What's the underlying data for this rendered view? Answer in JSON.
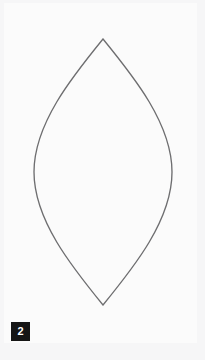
{
  "canvas": {
    "width": 205,
    "height": 360,
    "background_color": "#f6f6f7",
    "page_color": "#fbfbfb"
  },
  "figure": {
    "name": "vesica-piscis-lens-outline",
    "stroke_color": "#6e6e70",
    "stroke_width": 1.35,
    "fill": "none",
    "geometry": {
      "apex_top": [
        103,
        39
      ],
      "apex_bottom": [
        103,
        305
      ],
      "leftmost": [
        34,
        172
      ],
      "rightmost": [
        172,
        172
      ],
      "width": 138,
      "height": 266
    },
    "path": "M 103 39 C 134 77 172 124 172 172 C 172 220 134 267 103 305 C 72 267 34 220 34 172 C 34 124 72 77 103 39 Z"
  },
  "badge": {
    "label": "2",
    "background_color": "#151515",
    "text_color": "#ffffff",
    "position": [
      11,
      322
    ],
    "size": [
      19,
      19
    ]
  }
}
